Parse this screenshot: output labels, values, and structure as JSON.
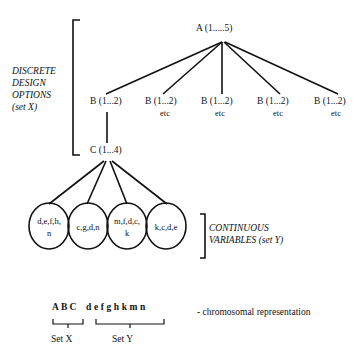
{
  "diagram": {
    "type": "tree",
    "root": {
      "label": "A (1.....5)"
    },
    "level_b": [
      {
        "label": "B (1...2)",
        "sub": ""
      },
      {
        "label": "B (1...2)",
        "sub": "etc"
      },
      {
        "label": "B (1...2)",
        "sub": "etc"
      },
      {
        "label": "B (1...2)",
        "sub": "etc"
      },
      {
        "label": "B (1...2)",
        "sub": "etc"
      }
    ],
    "level_c": {
      "label": "C (1...4)"
    },
    "circles": [
      {
        "line1": "d,e,f,h,",
        "line2": "n"
      },
      {
        "line1": "c,g,d,n",
        "line2": ""
      },
      {
        "line1": "m,f,d,c,",
        "line2": "k"
      },
      {
        "line1": "k,c,d,e",
        "line2": ""
      }
    ],
    "bracket_x_label": {
      "line1": "DISCRETE",
      "line2": "DESIGN",
      "line3": "OPTIONS",
      "line4": "(set X)"
    },
    "bracket_y_label": {
      "line1": "CONTINUOUS",
      "line2": "VARIABLES (set Y)"
    },
    "chromosome": {
      "set_x_genes": "ABC",
      "set_y_genes": "defghkmn",
      "set_x_label": "Set X",
      "set_y_label": "Set Y",
      "caption": "- chromosomal representation"
    },
    "colors": {
      "line": "#111111",
      "background": "#ffffff"
    }
  }
}
